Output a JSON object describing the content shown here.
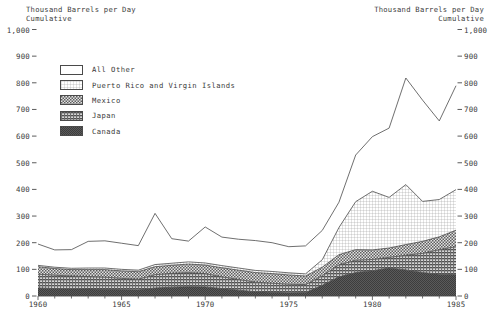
{
  "axis_caption": {
    "left_line1": "Thousand Barrels per Day",
    "left_line2": "Cumulative",
    "right_line1": "Thousand Barrels per Day",
    "right_line2": "Cumulative"
  },
  "legend": {
    "items": [
      {
        "label": "All Other",
        "pattern": "blank",
        "swatch_name": "legend-swatch-all-other"
      },
      {
        "label": "Puerto Rico and Virgin Islands",
        "pattern": "fine-grid",
        "swatch_name": "legend-swatch-puerto-rico"
      },
      {
        "label": "Mexico",
        "pattern": "checker",
        "swatch_name": "legend-swatch-mexico"
      },
      {
        "label": "Japan",
        "pattern": "horizontal-lines",
        "swatch_name": "legend-swatch-japan"
      },
      {
        "label": "Canada",
        "pattern": "dense-dark",
        "swatch_name": "legend-swatch-canada"
      }
    ]
  },
  "colors": {
    "ink": "#3a3a3a",
    "line": "#4a4a4a",
    "all_other": "#ffffff",
    "puerto_rico": "#f2f2f2",
    "mexico": "#9a9a9a",
    "japan": "#8a8a8a",
    "canada": "#6e6e6e",
    "background": "#ffffff"
  },
  "chart_data": {
    "type": "area",
    "stacked": true,
    "title": "",
    "subtitle": "",
    "xlabel": "",
    "ylabel": "Thousand Barrels per Day Cumulative",
    "ylabel_right": "Thousand Barrels per Day Cumulative",
    "xlim": [
      1960,
      1985
    ],
    "ylim": [
      0,
      1000
    ],
    "grid": false,
    "legend_position": "upper-left-inside",
    "y_ticks": [
      0,
      100,
      200,
      300,
      400,
      500,
      600,
      700,
      800,
      900,
      1000
    ],
    "y_tick_labels": [
      "0",
      "100",
      "200",
      "300",
      "400",
      "500",
      "600",
      "700",
      "800",
      "900",
      "1,000"
    ],
    "y_ticks_right": [
      0,
      100,
      200,
      300,
      400,
      500,
      600,
      700,
      800,
      900,
      1000
    ],
    "y_tick_labels_right": [
      "0",
      "100",
      "200",
      "300",
      "400",
      "500",
      "600",
      "700",
      "800",
      "900",
      "1,000"
    ],
    "x_ticks": [
      1960,
      1965,
      1970,
      1975,
      1980,
      1985
    ],
    "x_tick_labels": [
      "1960",
      "1965",
      "1970",
      "1975",
      "1980",
      "1985"
    ],
    "x_minor_tick_interval": 1,
    "x": [
      1960,
      1961,
      1962,
      1963,
      1964,
      1965,
      1966,
      1967,
      1968,
      1969,
      1970,
      1971,
      1972,
      1973,
      1974,
      1975,
      1976,
      1977,
      1978,
      1979,
      1980,
      1981,
      1982,
      1983,
      1984,
      1985
    ],
    "series": [
      {
        "name": "Canada",
        "pattern": "dense-dark",
        "values": [
          30,
          28,
          27,
          26,
          25,
          24,
          23,
          30,
          33,
          35,
          34,
          28,
          22,
          16,
          14,
          12,
          13,
          40,
          72,
          88,
          95,
          105,
          98,
          88,
          82,
          80
        ]
      },
      {
        "name": "Japan",
        "pattern": "horizontal-lines",
        "values": [
          52,
          50,
          48,
          47,
          46,
          42,
          40,
          50,
          52,
          53,
          50,
          44,
          40,
          36,
          34,
          32,
          30,
          36,
          45,
          46,
          42,
          40,
          55,
          72,
          92,
          105
        ]
      },
      {
        "name": "Mexico",
        "pattern": "checker",
        "values": [
          28,
          25,
          24,
          26,
          28,
          28,
          28,
          30,
          30,
          32,
          32,
          34,
          35,
          36,
          36,
          35,
          32,
          32,
          38,
          40,
          36,
          35,
          40,
          45,
          48,
          62
        ]
      },
      {
        "name": "Puerto Rico and Virgin Islands",
        "pattern": "fine-grid",
        "values": [
          5,
          5,
          5,
          6,
          6,
          6,
          6,
          8,
          8,
          8,
          8,
          8,
          8,
          8,
          8,
          8,
          8,
          28,
          102,
          180,
          220,
          190,
          225,
          150,
          140,
          152
        ]
      },
      {
        "name": "All Other",
        "pattern": "blank",
        "values": [
          80,
          65,
          70,
          100,
          102,
          98,
          92,
          192,
          92,
          78,
          135,
          107,
          108,
          112,
          108,
          98,
          105,
          110,
          95,
          175,
          205,
          260,
          400,
          380,
          295,
          390
        ]
      }
    ],
    "totals": [
      195,
      173,
      174,
      205,
      207,
      198,
      189,
      310,
      215,
      206,
      259,
      221,
      213,
      208,
      200,
      185,
      188,
      246,
      352,
      529,
      598,
      630,
      818,
      735,
      657,
      789
    ]
  }
}
